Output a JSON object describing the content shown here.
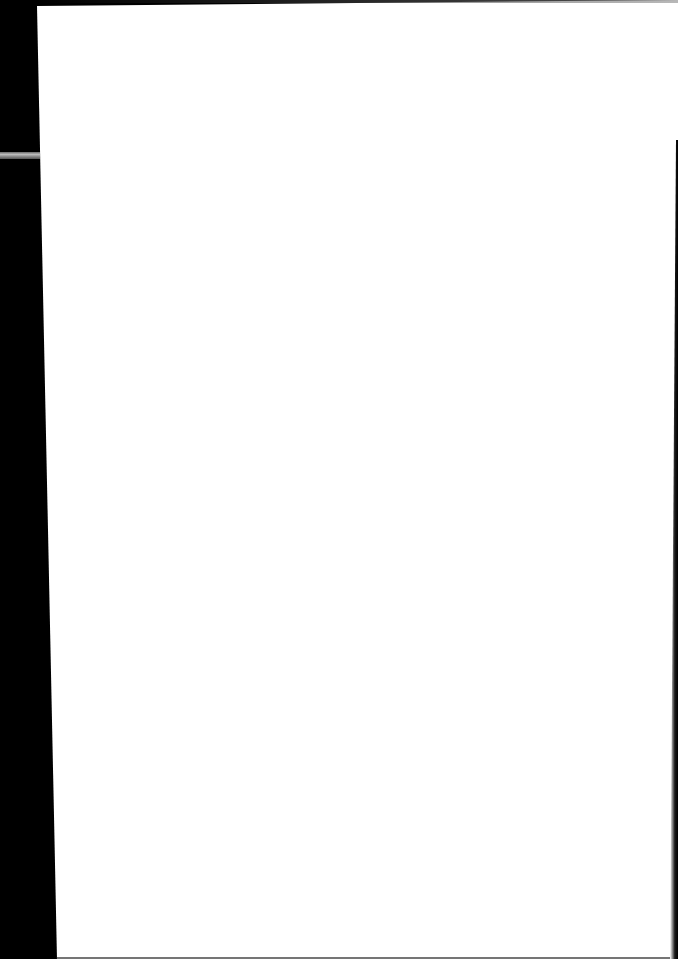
{
  "document": {
    "type": "scanned-page",
    "content": "",
    "is_blank": true
  },
  "colors": {
    "background": "#000000",
    "page": "#ffffff",
    "scan_streak": "#bdbdbd"
  }
}
